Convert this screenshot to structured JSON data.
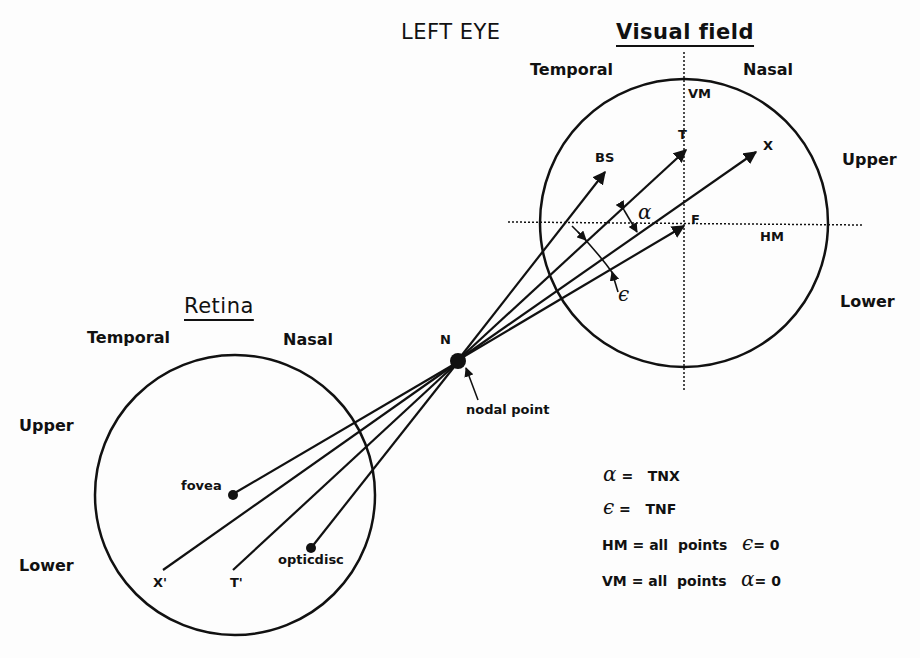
{
  "header": {
    "eye": "LEFT EYE",
    "visual_field_title": "Visual field",
    "retina_title": "Retina"
  },
  "visual_field": {
    "temporal": "Temporal",
    "nasal": "Nasal",
    "upper": "Upper",
    "lower": "Lower",
    "vm": "VM",
    "hm": "HM",
    "points": {
      "t": "T",
      "x": "X",
      "bs": "BS",
      "f": "F"
    },
    "alpha": "α",
    "epsilon": "ϵ"
  },
  "retina": {
    "temporal": "Temporal",
    "nasal": "Nasal",
    "upper": "Upper",
    "lower": "Lower",
    "fovea": "fovea",
    "optic_disc": "opticdisc",
    "x_prime": "X'",
    "t_prime": "T'"
  },
  "nodal": {
    "n": "N",
    "label": "nodal point"
  },
  "legend": [
    {
      "sym": "α",
      "text": "=   TNX"
    },
    {
      "sym": "ϵ",
      "text": "=   TNF"
    },
    {
      "pre": "HM = all  points",
      "sym": "ϵ",
      "post": "= 0"
    },
    {
      "pre": "VM = all  points",
      "sym": "α",
      "post": "= 0"
    }
  ]
}
